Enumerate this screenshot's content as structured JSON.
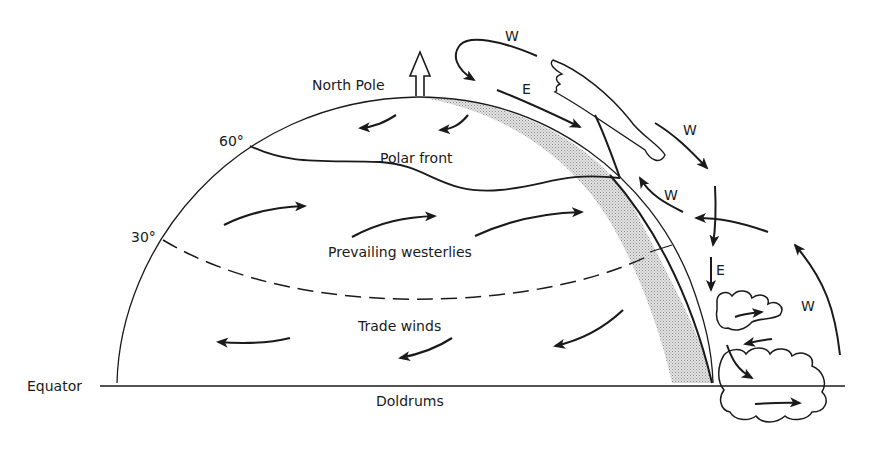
{
  "diagram": {
    "type": "atmospheric-circulation-cross-section",
    "labels": {
      "north_pole": "North Pole",
      "lat_60": "60°",
      "lat_30": "30°",
      "equator": "Equator",
      "polar_front": "Polar front",
      "prevailing_westerlies": "Prevailing westerlies",
      "trade_winds": "Trade winds",
      "doldrums": "Doldrums"
    },
    "wind_labels": {
      "upper_west_top": "W",
      "upper_east_top": "E",
      "upper_west_right": "W",
      "mid_west": "W",
      "lower_east": "E",
      "lower_west_right": "W"
    },
    "colors": {
      "line": "#1a1a1a",
      "stipple": "#b8b8b8",
      "background": "#ffffff"
    }
  }
}
